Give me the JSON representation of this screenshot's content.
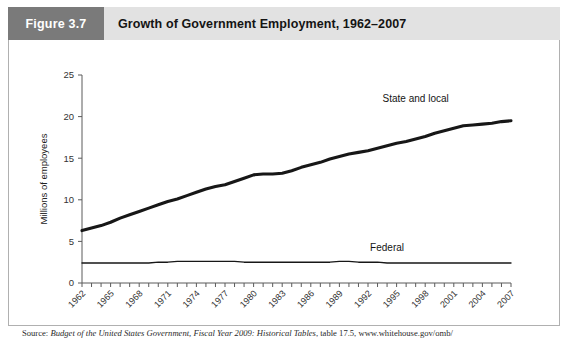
{
  "header": {
    "figure_number": "Figure 3.7",
    "title": "Growth of Government Employment, 1962–2007",
    "number_block_color": "#7a7a7a",
    "title_block_color": "#e2e2e2"
  },
  "source": {
    "prefix": "Source:",
    "italic_part": "Budget of the United States Government, Fiscal Year 2009: Historical Tables",
    "suffix": ", table 17.5, www.whitehouse.gov/omb/"
  },
  "chart_data": {
    "type": "line",
    "title": "Growth of Government Employment, 1962–2007",
    "xlabel": "",
    "ylabel": "Millions of employees",
    "xlim": [
      1962,
      2007
    ],
    "ylim": [
      0,
      25
    ],
    "yticks": [
      0,
      5,
      10,
      15,
      20,
      25
    ],
    "ytick_labels": [
      "0",
      "5",
      "10",
      "15",
      "20",
      "25"
    ],
    "xticks": [
      1962,
      1963,
      1964,
      1965,
      1966,
      1967,
      1968,
      1969,
      1970,
      1971,
      1972,
      1973,
      1974,
      1975,
      1976,
      1977,
      1978,
      1979,
      1980,
      1981,
      1982,
      1983,
      1984,
      1985,
      1986,
      1987,
      1988,
      1989,
      1990,
      1991,
      1992,
      1993,
      1994,
      1995,
      1996,
      1997,
      1998,
      1999,
      2000,
      2001,
      2002,
      2003,
      2004,
      2005,
      2006,
      2007
    ],
    "xtick_labels": [
      "1962",
      "1965",
      "1968",
      "1971",
      "1974",
      "1977",
      "1980",
      "1983",
      "1986",
      "1989",
      "1992",
      "1995",
      "1998",
      "2001",
      "2004",
      "2007"
    ],
    "xtick_label_years": [
      1962,
      1965,
      1968,
      1971,
      1974,
      1977,
      1980,
      1983,
      1986,
      1989,
      1992,
      1995,
      1998,
      2001,
      2004,
      2007
    ],
    "grid": false,
    "legend_position": "inline-labels",
    "x": [
      1962,
      1963,
      1964,
      1965,
      1966,
      1967,
      1968,
      1969,
      1970,
      1971,
      1972,
      1973,
      1974,
      1975,
      1976,
      1977,
      1978,
      1979,
      1980,
      1981,
      1982,
      1983,
      1984,
      1985,
      1986,
      1987,
      1988,
      1989,
      1990,
      1991,
      1992,
      1993,
      1994,
      1995,
      1996,
      1997,
      1998,
      1999,
      2000,
      2001,
      2002,
      2003,
      2004,
      2005,
      2006,
      2007
    ],
    "series": [
      {
        "name": "State and local",
        "label": "State and local",
        "color": "#171717",
        "line_width": "thick",
        "label_x_year": 1997,
        "label_y_value": 21.8,
        "values": [
          6.3,
          6.6,
          6.9,
          7.3,
          7.8,
          8.2,
          8.6,
          9.0,
          9.4,
          9.8,
          10.1,
          10.5,
          10.9,
          11.3,
          11.6,
          11.8,
          12.2,
          12.6,
          13.0,
          13.1,
          13.1,
          13.2,
          13.5,
          13.9,
          14.2,
          14.5,
          14.9,
          15.2,
          15.5,
          15.7,
          15.9,
          16.2,
          16.5,
          16.8,
          17.0,
          17.3,
          17.6,
          18.0,
          18.3,
          18.6,
          18.9,
          19.0,
          19.1,
          19.2,
          19.4,
          19.5
        ]
      },
      {
        "name": "Federal",
        "label": "Federal",
        "color": "#171717",
        "line_width": "thin",
        "label_x_year": 1994,
        "label_y_value": 3.9,
        "values": [
          2.4,
          2.4,
          2.4,
          2.4,
          2.4,
          2.4,
          2.4,
          2.4,
          2.5,
          2.5,
          2.6,
          2.6,
          2.6,
          2.6,
          2.6,
          2.6,
          2.6,
          2.5,
          2.5,
          2.5,
          2.5,
          2.5,
          2.5,
          2.5,
          2.5,
          2.5,
          2.5,
          2.6,
          2.6,
          2.5,
          2.5,
          2.5,
          2.4,
          2.4,
          2.4,
          2.4,
          2.4,
          2.4,
          2.4,
          2.4,
          2.4,
          2.4,
          2.4,
          2.4,
          2.4,
          2.4
        ]
      }
    ]
  }
}
